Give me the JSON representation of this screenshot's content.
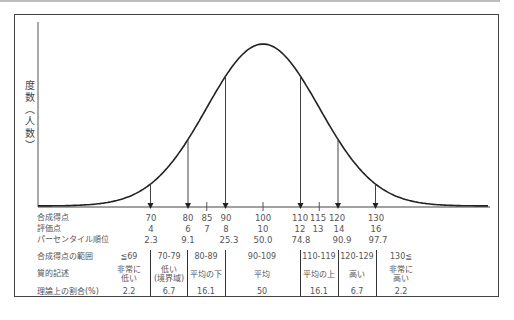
{
  "chart_data": {
    "type": "line",
    "title": "",
    "xlabel": "合成得点",
    "ylabel": "度数（人数）",
    "distribution": "normal",
    "mean": 100,
    "sd": 15,
    "xlim": [
      40,
      160
    ],
    "grid": false,
    "arrow_marks": [
      70,
      80,
      90,
      110,
      120,
      130
    ],
    "tick_marks": [
      85,
      100,
      115
    ],
    "scale_rows": [
      {
        "label": "合成得点",
        "values": [
          "70",
          "80",
          "85",
          "90",
          "100",
          "110",
          "115",
          "120",
          "130"
        ]
      },
      {
        "label": "評価点",
        "values": [
          "4",
          "6",
          "7",
          "8",
          "10",
          "12",
          "13",
          "14",
          "16"
        ]
      },
      {
        "label": "パーセンタイル順位",
        "values": [
          "2.3",
          "9.1",
          "",
          "25.3",
          "50.0",
          "74.8",
          "",
          "90.9",
          "97.7"
        ]
      }
    ],
    "table": {
      "headers": [
        "合成得点の範囲",
        "質的記述",
        "理論上の割合(%)"
      ],
      "columns": [
        {
          "range": "≦69",
          "desc": [
            "非常に",
            "低い"
          ],
          "pct": "2.2"
        },
        {
          "range": "70-79",
          "desc": [
            "低い",
            "(境界域)"
          ],
          "pct": "6.7"
        },
        {
          "range": "80-89",
          "desc": [
            "平均の下"
          ],
          "pct": "16.1"
        },
        {
          "range": "90-109",
          "desc": [
            "平均"
          ],
          "pct": "50"
        },
        {
          "range": "110-119",
          "desc": [
            "平均の上"
          ],
          "pct": "16.1"
        },
        {
          "range": "120-129",
          "desc": [
            "高い"
          ],
          "pct": "6.7"
        },
        {
          "range": "130≦",
          "desc": [
            "非常に",
            "高い"
          ],
          "pct": "2.2"
        }
      ]
    }
  },
  "ylabel_chars": [
    "度",
    "数",
    "︵",
    "人",
    "数",
    "︶"
  ],
  "row_labels": {
    "composite": "合成得点",
    "scaled": "評価点",
    "percentile": "パーセンタイル順位",
    "range": "合成得点の範囲",
    "desc": "質的記述",
    "pct": "理論上の割合(%)"
  },
  "composite": [
    "70",
    "80",
    "85",
    "90",
    "100",
    "110",
    "115",
    "120",
    "130"
  ],
  "scaled": [
    "4",
    "6",
    "7",
    "8",
    "10",
    "12",
    "13",
    "14",
    "16"
  ],
  "percentile": [
    "2.3",
    "9.1",
    "25.3",
    "50.0",
    "74.8",
    "90.9",
    "97.7"
  ],
  "ranges": [
    "≦69",
    "70-79",
    "80-89",
    "90-109",
    "110-119",
    "120-129",
    "130≦"
  ],
  "desc": [
    [
      "非常に",
      "低い"
    ],
    [
      "低い",
      "(境界域)"
    ],
    [
      "平均の下"
    ],
    [
      "平均"
    ],
    [
      "平均の上"
    ],
    [
      "高い"
    ],
    [
      "非常に",
      "高い"
    ]
  ],
  "pct": [
    "2.2",
    "6.7",
    "16.1",
    "50",
    "16.1",
    "6.7",
    "2.2"
  ]
}
